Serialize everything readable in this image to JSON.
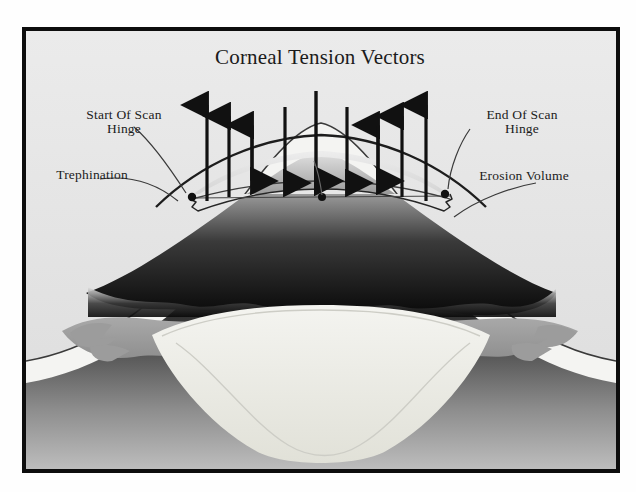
{
  "figure": {
    "title": "Corneal Tension Vectors",
    "labels": {
      "start_scan_hinge": "Start Of Scan\nHinge",
      "end_scan_hinge": "End Of Scan\nHinge",
      "trephination": "Trephination",
      "erosion_volume": "Erosion Volume"
    },
    "colors": {
      "frame": "#0d0d0d",
      "background": "#e9e9e9",
      "arrow": "#111111",
      "outline": "#2b2b2b",
      "text": "#1b1b1b",
      "stroma_dark": "#101010",
      "iris_gray": "#9a9a9a",
      "lens_light": "#e2e2dc",
      "sclera_light": "#f2f2f0"
    },
    "vectors": [
      {
        "id": "v1",
        "x": 203,
        "direction": "up",
        "top": 99,
        "bottom": 197
      },
      {
        "id": "v2",
        "x": 225,
        "direction": "up",
        "top": 110,
        "bottom": 193
      },
      {
        "id": "v3",
        "x": 248,
        "direction": "both",
        "top": 118,
        "bottom": 174
      },
      {
        "id": "v4",
        "x": 281,
        "direction": "down",
        "top": 100,
        "bottom": 178
      },
      {
        "id": "v5",
        "x": 312,
        "direction": "down",
        "top": 86,
        "bottom": 176
      },
      {
        "id": "v6",
        "x": 343,
        "direction": "down",
        "top": 101,
        "bottom": 177
      },
      {
        "id": "v7",
        "x": 374,
        "direction": "both",
        "top": 119,
        "bottom": 175
      },
      {
        "id": "v8",
        "x": 398,
        "direction": "up",
        "top": 110,
        "bottom": 192
      },
      {
        "id": "v9",
        "x": 422,
        "direction": "up",
        "top": 99,
        "bottom": 197
      }
    ],
    "hinge_points": [
      {
        "id": "start-hinge-dot",
        "x": 188,
        "y": 190
      },
      {
        "id": "center-dot",
        "x": 320,
        "y": 190
      },
      {
        "id": "end-hinge-dot",
        "x": 440,
        "y": 188
      }
    ]
  }
}
